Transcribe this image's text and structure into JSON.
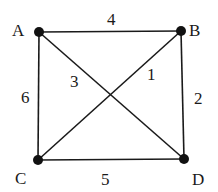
{
  "diagram": {
    "type": "weighted-graph",
    "background": "#ffffff",
    "line_color": "#1a1a1a",
    "nodes": [
      {
        "id": "A",
        "label": "A",
        "x": 39,
        "y": 32,
        "label_x": 12,
        "label_y": 36
      },
      {
        "id": "B",
        "label": "B",
        "x": 181,
        "y": 31,
        "label_x": 189,
        "label_y": 36
      },
      {
        "id": "C",
        "label": "C",
        "x": 38,
        "y": 160,
        "label_x": 15,
        "label_y": 184
      },
      {
        "id": "D",
        "label": "D",
        "x": 184,
        "y": 159,
        "label_x": 192,
        "label_y": 185
      }
    ],
    "edges": [
      {
        "from": "A",
        "to": "B",
        "weight": "4",
        "label_x": 107,
        "label_y": 25
      },
      {
        "from": "B",
        "to": "D",
        "weight": "2",
        "label_x": 194,
        "label_y": 104
      },
      {
        "from": "C",
        "to": "D",
        "weight": "5",
        "label_x": 101,
        "label_y": 185
      },
      {
        "from": "A",
        "to": "C",
        "weight": "6",
        "label_x": 21,
        "label_y": 103
      },
      {
        "from": "A",
        "to": "D",
        "weight": "3",
        "label_x": 70,
        "label_y": 87
      },
      {
        "from": "B",
        "to": "C",
        "weight": "1",
        "label_x": 147,
        "label_y": 80
      }
    ]
  }
}
